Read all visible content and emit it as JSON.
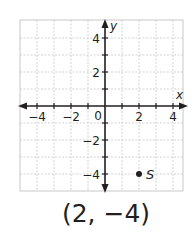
{
  "chart_data": {
    "type": "scatter",
    "title": "",
    "xlabel": "x",
    "ylabel": "y",
    "xlim": [
      -5,
      5
    ],
    "ylim": [
      -5,
      5
    ],
    "grid": true,
    "x_ticks": [
      -4,
      -2,
      0,
      2,
      4
    ],
    "x_tick_labels": [
      "−4",
      "−2",
      "0",
      "2",
      "4"
    ],
    "y_ticks": [
      4,
      2,
      -2,
      -4
    ],
    "y_tick_labels": [
      "4",
      "2",
      "−2",
      "−4"
    ],
    "origin_label": "0",
    "points": [
      {
        "label": "S",
        "x": 2,
        "y": -4
      }
    ]
  },
  "caption": "(2, −4)",
  "colors": {
    "axis": "#231f20",
    "grid": "#c8c8c8",
    "point": "#231f20",
    "text": "#231f20"
  }
}
